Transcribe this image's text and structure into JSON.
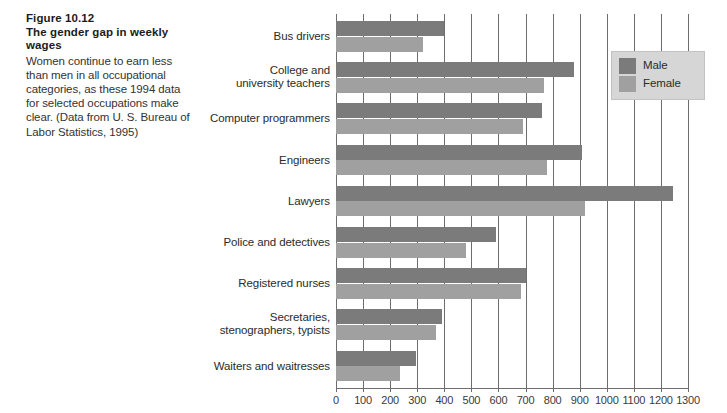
{
  "caption": {
    "figure_number": "Figure 10.12",
    "figure_title": "The gender gap in weekly wages",
    "body": "Women continue to earn less than men in all occupational categories, as these 1994 data for selected occupations make clear. (Data from U. S. Bureau of Labor Statistics, 1995)"
  },
  "legend": {
    "items": [
      {
        "label": "Male",
        "color": "#7b7b7b"
      },
      {
        "label": "Female",
        "color": "#a0a0a0"
      }
    ]
  },
  "chart_data": {
    "type": "bar",
    "orientation": "horizontal",
    "title": "The gender gap in weekly wages",
    "xlabel": "",
    "ylabel": "",
    "xlim": [
      0,
      1300
    ],
    "grid": true,
    "legend_position": "upper-right",
    "tick_labels": [
      "0",
      "100",
      "200",
      "300",
      "400",
      "500",
      "600",
      "700",
      "800",
      "900",
      "1000",
      "1100",
      "1200",
      "1300"
    ],
    "ticks": [
      0,
      100,
      200,
      300,
      400,
      500,
      600,
      700,
      800,
      900,
      1000,
      1100,
      1200,
      1300
    ],
    "categories": [
      "Bus drivers",
      "College and university teachers",
      "Computer programmers",
      "Engineers",
      "Lawyers",
      "Police and detectives",
      "Registered nurses",
      "Secretaries, stenographers, typists",
      "Waiters and waitresses"
    ],
    "category_lines": [
      [
        "Bus drivers"
      ],
      [
        "College and",
        "university teachers"
      ],
      [
        "Computer programmers"
      ],
      [
        "Engineers"
      ],
      [
        "Lawyers"
      ],
      [
        "Police and detectives"
      ],
      [
        "Registered nurses"
      ],
      [
        "Secretaries,",
        "stenographers, typists"
      ],
      [
        "Waiters and waitresses"
      ]
    ],
    "series": [
      {
        "name": "Male",
        "color": "#7b7b7b",
        "values": [
          400,
          880,
          760,
          910,
          1245,
          590,
          700,
          390,
          295
        ]
      },
      {
        "name": "Female",
        "color": "#a0a0a0",
        "values": [
          320,
          770,
          690,
          780,
          920,
          480,
          685,
          370,
          235
        ]
      }
    ]
  }
}
